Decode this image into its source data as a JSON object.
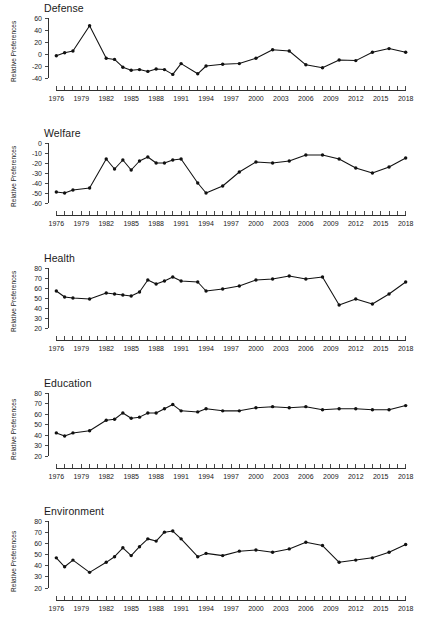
{
  "figure": {
    "width": 423,
    "height": 635,
    "background": "#ffffff",
    "line_color": "#111111",
    "axis_color": "#1a1a1a",
    "ylabel_text": "Relative Preferences"
  },
  "chart_data": [
    {
      "type": "line",
      "title": "Defense",
      "xlabel": "",
      "ylabel": "Relative Preferences",
      "grid": false,
      "legend": "none",
      "xlim": [
        1975,
        2019
      ],
      "ylim": [
        -40,
        60
      ],
      "ytick_values": [
        -40,
        -20,
        0,
        20,
        40,
        60
      ],
      "ytick_labels": [
        "-40",
        "-20",
        "0",
        "20",
        "40",
        "60"
      ],
      "xtick_labels": [
        "1976",
        "1979",
        "1982",
        "1985",
        "1988",
        "1991",
        "1994",
        "1997",
        "2000",
        "2003",
        "2006",
        "2009",
        "2012",
        "2015",
        "2018"
      ],
      "xtick_label_values": [
        1976,
        1979,
        1982,
        1985,
        1988,
        1991,
        1994,
        1997,
        2000,
        2003,
        2006,
        2009,
        2012,
        2015,
        2018
      ],
      "x": [
        1976,
        1977,
        1978,
        1980,
        1982,
        1983,
        1984,
        1985,
        1986,
        1987,
        1988,
        1989,
        1990,
        1991,
        1993,
        1994,
        1996,
        1998,
        2000,
        2002,
        2004,
        2006,
        2008,
        2010,
        2012,
        2014,
        2016,
        2018
      ],
      "values": [
        -3,
        2,
        5,
        47,
        -7,
        -9,
        -22,
        -27,
        -26,
        -29,
        -25,
        -26,
        -34,
        -16,
        -33,
        -20,
        -17,
        -16,
        -7,
        7,
        5,
        -18,
        -23,
        -10,
        -11,
        3,
        9,
        3
      ]
    },
    {
      "type": "line",
      "title": "Welfare",
      "xlabel": "",
      "ylabel": "Relative Preferences",
      "grid": false,
      "legend": "none",
      "xlim": [
        1975,
        2019
      ],
      "ylim": [
        -60,
        0
      ],
      "ytick_values": [
        -60,
        -50,
        -40,
        -30,
        -20,
        -10,
        0
      ],
      "ytick_labels": [
        "-60",
        "-50",
        "-40",
        "-30",
        "-20",
        "-10",
        "0"
      ],
      "xtick_labels": [
        "1976",
        "1979",
        "1982",
        "1985",
        "1988",
        "1991",
        "1994",
        "1997",
        "2000",
        "2003",
        "2006",
        "2009",
        "2012",
        "2015",
        "2018"
      ],
      "xtick_label_values": [
        1976,
        1979,
        1982,
        1985,
        1988,
        1991,
        1994,
        1997,
        2000,
        2003,
        2006,
        2009,
        2012,
        2015,
        2018
      ],
      "x": [
        1976,
        1977,
        1978,
        1980,
        1982,
        1983,
        1984,
        1985,
        1986,
        1987,
        1988,
        1989,
        1990,
        1991,
        1993,
        1994,
        1996,
        1998,
        2000,
        2002,
        2004,
        2006,
        2008,
        2010,
        2012,
        2014,
        2016,
        2018
      ],
      "values": [
        -49,
        -50,
        -47,
        -45,
        -16,
        -26,
        -17,
        -27,
        -18,
        -14,
        -20,
        -20,
        -17,
        -16,
        -40,
        -50,
        -43,
        -29,
        -19,
        -20,
        -18,
        -12,
        -12,
        -16,
        -25,
        -30,
        -24,
        -15
      ]
    },
    {
      "type": "line",
      "title": "Health",
      "xlabel": "",
      "ylabel": "Relative Preferences",
      "grid": false,
      "legend": "none",
      "xlim": [
        1975,
        2019
      ],
      "ylim": [
        20,
        80
      ],
      "ytick_values": [
        20,
        30,
        40,
        50,
        60,
        70,
        80
      ],
      "ytick_labels": [
        "20",
        "30",
        "40",
        "50",
        "60",
        "70",
        "80"
      ],
      "xtick_labels": [
        "1976",
        "1979",
        "1982",
        "1985",
        "1988",
        "1991",
        "1994",
        "1997",
        "2000",
        "2003",
        "2006",
        "2009",
        "2012",
        "2015",
        "2018"
      ],
      "xtick_label_values": [
        1976,
        1979,
        1982,
        1985,
        1988,
        1991,
        1994,
        1997,
        2000,
        2003,
        2006,
        2009,
        2012,
        2015,
        2018
      ],
      "x": [
        1976,
        1977,
        1978,
        1980,
        1982,
        1983,
        1984,
        1985,
        1986,
        1987,
        1988,
        1989,
        1990,
        1991,
        1993,
        1994,
        1996,
        1998,
        2000,
        2002,
        2004,
        2006,
        2008,
        2010,
        2012,
        2014,
        2016,
        2018
      ],
      "values": [
        57,
        51,
        50,
        49,
        55,
        54,
        53,
        52,
        56,
        68,
        64,
        67,
        71,
        67,
        66,
        57,
        59,
        62,
        68,
        69,
        72,
        69,
        71,
        43,
        49,
        44,
        54,
        66
      ]
    },
    {
      "type": "line",
      "title": "Education",
      "xlabel": "",
      "ylabel": "Relative Preferences",
      "grid": false,
      "legend": "none",
      "xlim": [
        1975,
        2019
      ],
      "ylim": [
        20,
        80
      ],
      "ytick_values": [
        20,
        30,
        40,
        50,
        60,
        70,
        80
      ],
      "ytick_labels": [
        "20",
        "30",
        "40",
        "50",
        "60",
        "70",
        "80"
      ],
      "xtick_labels": [
        "1976",
        "1979",
        "1982",
        "1985",
        "1988",
        "1991",
        "1994",
        "1997",
        "2000",
        "2003",
        "2006",
        "2009",
        "2012",
        "2015",
        "2018"
      ],
      "xtick_label_values": [
        1976,
        1979,
        1982,
        1985,
        1988,
        1991,
        1994,
        1997,
        2000,
        2003,
        2006,
        2009,
        2012,
        2015,
        2018
      ],
      "x": [
        1976,
        1977,
        1978,
        1980,
        1982,
        1983,
        1984,
        1985,
        1986,
        1987,
        1988,
        1989,
        1990,
        1991,
        1993,
        1994,
        1996,
        1998,
        2000,
        2002,
        2004,
        2006,
        2008,
        2010,
        2012,
        2014,
        2016,
        2018
      ],
      "values": [
        42,
        39,
        42,
        44,
        54,
        55,
        61,
        56,
        57,
        61,
        61,
        65,
        69,
        63,
        62,
        65,
        63,
        63,
        66,
        67,
        66,
        67,
        64,
        65,
        65,
        64,
        64,
        68
      ]
    },
    {
      "type": "line",
      "title": "Environment",
      "xlabel": "",
      "ylabel": "Relative Preferences",
      "grid": false,
      "legend": "none",
      "xlim": [
        1975,
        2019
      ],
      "ylim": [
        20,
        80
      ],
      "ytick_values": [
        20,
        30,
        40,
        50,
        60,
        70,
        80
      ],
      "ytick_labels": [
        "20",
        "30",
        "40",
        "50",
        "60",
        "70",
        "80"
      ],
      "xtick_labels": [
        "1976",
        "1979",
        "1982",
        "1985",
        "1988",
        "1991",
        "1994",
        "1997",
        "2000",
        "2003",
        "2006",
        "2009",
        "2012",
        "2015",
        "2018"
      ],
      "xtick_label_values": [
        1976,
        1979,
        1982,
        1985,
        1988,
        1991,
        1994,
        1997,
        2000,
        2003,
        2006,
        2009,
        2012,
        2015,
        2018
      ],
      "x": [
        1976,
        1977,
        1978,
        1980,
        1982,
        1983,
        1984,
        1985,
        1986,
        1987,
        1988,
        1989,
        1990,
        1991,
        1993,
        1994,
        1996,
        1998,
        2000,
        2002,
        2004,
        2006,
        2008,
        2010,
        2012,
        2014,
        2016,
        2018
      ],
      "values": [
        47,
        39,
        45,
        34,
        43,
        48,
        56,
        49,
        57,
        64,
        62,
        70,
        71,
        64,
        48,
        51,
        49,
        53,
        54,
        52,
        55,
        61,
        58,
        43,
        45,
        47,
        52,
        59
      ]
    }
  ]
}
